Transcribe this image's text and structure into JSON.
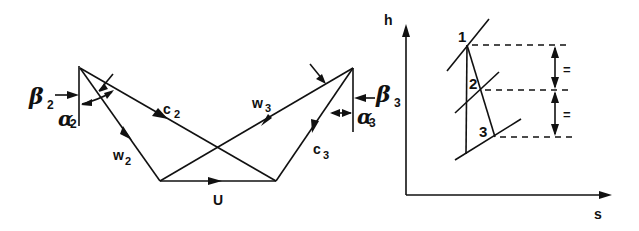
{
  "velocity_triangles": {
    "inlet_relative_angle": {
      "symbol": "β",
      "subscript": "2"
    },
    "inlet_absolute_angle": {
      "symbol": "α",
      "subscript": "2"
    },
    "outlet_relative_angle": {
      "symbol": "β",
      "subscript": "3"
    },
    "outlet_absolute_angle": {
      "symbol": "α",
      "subscript": "3"
    },
    "inlet_absolute_velocity": {
      "symbol": "c",
      "subscript": "2"
    },
    "inlet_relative_velocity": {
      "symbol": "w",
      "subscript": "2"
    },
    "outlet_relative_velocity": {
      "symbol": "w",
      "subscript": "3"
    },
    "outlet_absolute_velocity": {
      "symbol": "c",
      "subscript": "3"
    },
    "blade_speed": {
      "symbol": "U"
    }
  },
  "hs_diagram": {
    "y_axis_label": "h",
    "x_axis_label": "s",
    "state_points": [
      "1",
      "2",
      "3"
    ],
    "equal_marks": [
      "=",
      "="
    ]
  },
  "colors": {
    "ink": "#111111",
    "background": "#ffffff"
  }
}
